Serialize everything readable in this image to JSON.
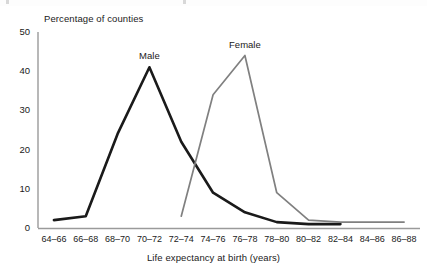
{
  "chart_data": {
    "type": "line",
    "title": "",
    "xlabel": "Life expectancy at birth (years)",
    "ylabel": "Percentage of counties",
    "categories": [
      "64–66",
      "66–68",
      "68–70",
      "70–72",
      "72–74",
      "74–76",
      "76–78",
      "78–80",
      "80–82",
      "82–84",
      "84–86",
      "86–88"
    ],
    "yticks": [
      0,
      10,
      20,
      30,
      40,
      50
    ],
    "ylim": [
      0,
      50
    ],
    "grid": false,
    "legend_position": "inline-annotation",
    "series": [
      {
        "name": "Male",
        "color": "#1a1a1a",
        "values": [
          2,
          3,
          24,
          41,
          22,
          9,
          4,
          1.5,
          1,
          1,
          null,
          null
        ]
      },
      {
        "name": "Female",
        "color": "#808080",
        "values": [
          null,
          null,
          null,
          null,
          3,
          34,
          44,
          9,
          2,
          1.5,
          1.5,
          1.5
        ]
      }
    ],
    "annotations": [
      {
        "text": "Male",
        "category": "70–72",
        "value": 41,
        "dx": 0,
        "dy": -6
      },
      {
        "text": "Female",
        "category": "76–78",
        "value": 44,
        "dx": 0,
        "dy": -6
      }
    ]
  },
  "axis": {
    "y_tick_labels": [
      "50",
      "40",
      "30",
      "20",
      "10",
      "0"
    ],
    "x_tick_labels": [
      "64–66",
      "66–68",
      "68–70",
      "70–72",
      "72–74",
      "74–76",
      "76–78",
      "78–80",
      "80–82",
      "82–84",
      "84–86",
      "86–88"
    ]
  },
  "labels": {
    "y_axis_title": "Percentage of counties",
    "x_axis_title": "Life expectancy at birth (years)",
    "male": "Male",
    "female": "Female"
  },
  "colors": {
    "male_line": "#1a1a1a",
    "female_line": "#808080",
    "axis": "#9a9a9a",
    "text": "#1a1a1a",
    "background": "#ffffff"
  }
}
